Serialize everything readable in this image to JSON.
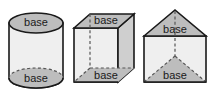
{
  "diagram": {
    "background_color": "#ffffff",
    "palette": {
      "outline": "#1a1a1a",
      "base_fill": "#bdbdbd",
      "front_fill": "#efefef",
      "side_fill": "#cfcfcf",
      "hidden_edge": "#555555",
      "label_color": "#1a1a1a"
    },
    "figures": [
      {
        "id": "cylinder",
        "name": "cylinder",
        "faces": [
          {
            "id": "cylinder-top-base",
            "role": "top base",
            "label": "base",
            "fill": "#bdbdbd",
            "shape": "ellipse"
          },
          {
            "id": "cylinder-lateral",
            "role": "lateral surface",
            "label": "",
            "fill": "#efefef",
            "shape": "rectangle"
          },
          {
            "id": "cylinder-bottom-base",
            "role": "bottom base",
            "label": "base",
            "fill": "#bdbdbd",
            "shape": "ellipse"
          }
        ]
      },
      {
        "id": "cuboid",
        "name": "rectangular prism",
        "faces": [
          {
            "id": "cuboid-top-base",
            "role": "top base",
            "label": "base",
            "fill": "#bdbdbd",
            "shape": "parallelogram"
          },
          {
            "id": "cuboid-front",
            "role": "front face",
            "label": "",
            "fill": "#efefef",
            "shape": "rectangle"
          },
          {
            "id": "cuboid-right",
            "role": "right face",
            "label": "",
            "fill": "#cfcfcf",
            "shape": "parallelogram"
          },
          {
            "id": "cuboid-bottom-base",
            "role": "bottom base",
            "label": "base",
            "fill": "#bdbdbd",
            "shape": "parallelogram"
          }
        ]
      },
      {
        "id": "triangular-prism",
        "name": "triangular prism",
        "faces": [
          {
            "id": "triprism-top-base",
            "role": "top base",
            "label": "base",
            "fill": "#bdbdbd",
            "shape": "triangle"
          },
          {
            "id": "triprism-front",
            "role": "front face",
            "label": "",
            "fill": "#efefef",
            "shape": "rectangle"
          },
          {
            "id": "triprism-bottom-base",
            "role": "bottom base",
            "label": "base",
            "fill": "#bdbdbd",
            "shape": "triangle"
          }
        ]
      }
    ],
    "labels": {
      "cylinder_top": "base",
      "cylinder_bottom": "base",
      "cuboid_top": "base",
      "cuboid_bottom": "base",
      "triprism_top": "base",
      "triprism_bottom": "base"
    }
  }
}
